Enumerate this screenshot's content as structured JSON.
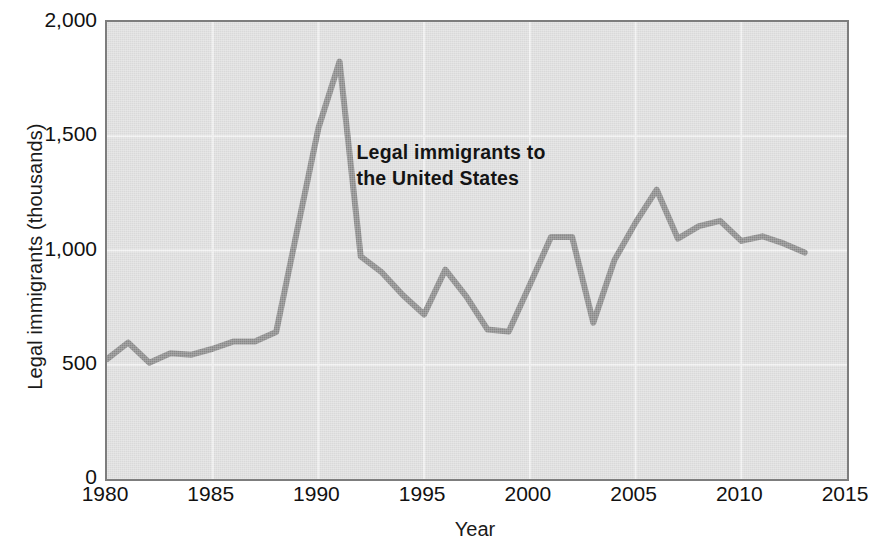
{
  "chart_data": {
    "type": "line",
    "title": "",
    "xlabel": "Year",
    "ylabel": "Legal immigrants (thousands)",
    "xlim": [
      1980,
      2015
    ],
    "ylim": [
      0,
      2000
    ],
    "xticks": [
      1980,
      1985,
      1990,
      1995,
      2000,
      2005,
      2010,
      2015
    ],
    "xtick_labels": [
      "1980",
      "1985",
      "1990",
      "1995",
      "2000",
      "2005",
      "2010",
      "2015"
    ],
    "yticks": [
      0,
      500,
      1000,
      1500,
      2000
    ],
    "ytick_labels": [
      "0",
      "500",
      "1,000",
      "1,500",
      "2,000"
    ],
    "grid": true,
    "grid_color": "#f2f2f2",
    "legend": "none",
    "annotations": [
      {
        "text": "Legal immigrants to\nthe United States",
        "x": 1991.8,
        "y": 1430
      }
    ],
    "series": [
      {
        "name": "Legal immigrants to the United States",
        "color": "#8a8a8a",
        "line_width": 6,
        "x": [
          1980,
          1981,
          1982,
          1983,
          1984,
          1985,
          1986,
          1987,
          1988,
          1989,
          1990,
          1991,
          1992,
          1993,
          1994,
          1995,
          1996,
          1997,
          1998,
          1999,
          2000,
          2001,
          2002,
          2003,
          2004,
          2005,
          2006,
          2007,
          2008,
          2009,
          2010,
          2011,
          2012,
          2013
        ],
        "values": [
          525,
          597,
          509,
          550,
          544,
          570,
          602,
          602,
          643,
          1091,
          1536,
          1827,
          974,
          904,
          804,
          720,
          916,
          798,
          654,
          645,
          850,
          1059,
          1059,
          684,
          958,
          1122,
          1266,
          1052,
          1107,
          1130,
          1042,
          1062,
          1031,
          991
        ]
      }
    ]
  },
  "axis": {
    "x_title": "Year",
    "y_title": "Legal immigrants (thousands)"
  },
  "annotation": {
    "line1": "Legal immigrants to",
    "line2": "the United States",
    "text": "Legal immigrants to\nthe United States"
  },
  "colors": {
    "line": "#8a8a8a",
    "plot_background": "#dedede",
    "plot_border": "#7d7d7d",
    "gridline": "#f2f2f2",
    "text": "#111111",
    "page_background": "#ffffff"
  }
}
